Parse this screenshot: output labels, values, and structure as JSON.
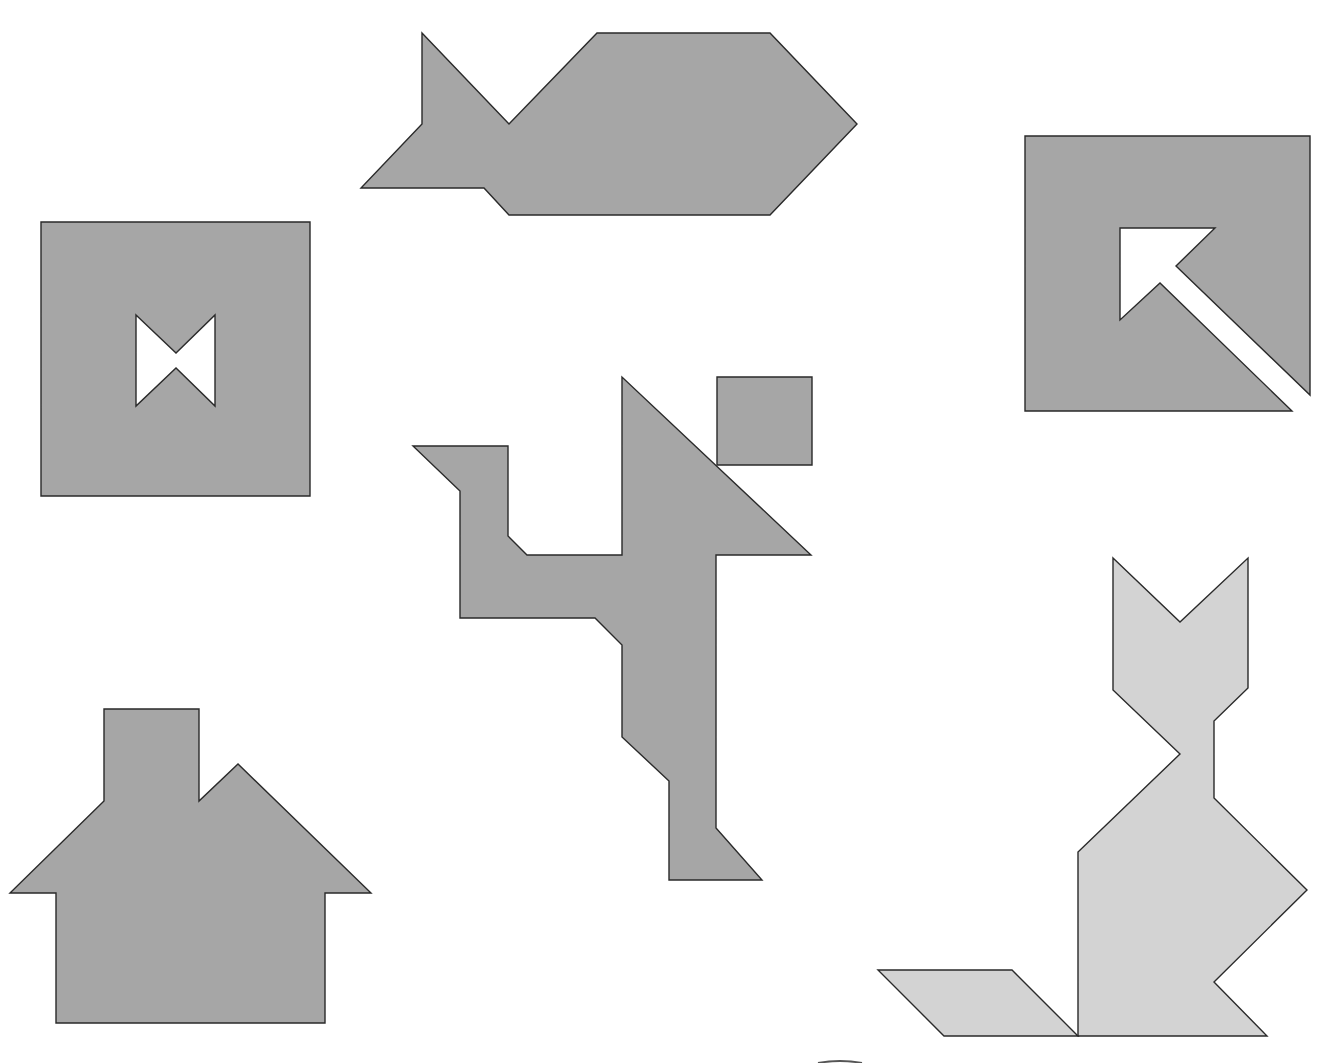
{
  "canvas": {
    "width": 1324,
    "height": 1063,
    "background": "#ffffff"
  },
  "colors": {
    "dark_fill": "#a6a6a6",
    "light_fill": "#d3d3d3",
    "hole_fill": "#ffffff",
    "stroke": "#2a2a2a"
  },
  "figures": [
    {
      "id": "fish",
      "label": "Fish",
      "fill": "dark_fill",
      "points": "422,33 509,124 597,33 770,33 857,124 770,215 509,215 484,188 361,188 422,124"
    },
    {
      "id": "square-with-bowtie",
      "label": "Square with bowtie hole",
      "fill": "dark_fill",
      "points": "41,222 310,222 310,496 41,496",
      "hole": "136,315 176,353 215,315 215,406 176,368 136,406"
    },
    {
      "id": "square-with-arrow",
      "label": "Square with arrow cut-out",
      "fill": "dark_fill",
      "points": "1025,136 1310,136 1310,395 1176,266 1215,228 1120,228 1120,320 1160,283 1292,411 1025,411"
    },
    {
      "id": "runner",
      "label": "Running figure",
      "fill": "dark_fill",
      "points": "413,446 508,446 508,536 527,555 622,555 622,377 811,555 716,555 716,828 762,880 669,880 669,781 622,737 622,645 595,618 460,618 460,491"
    },
    {
      "id": "runner-head",
      "label": "Runner head square",
      "fill": "dark_fill",
      "points": "717,377 812,377 812,465 717,465"
    },
    {
      "id": "house",
      "label": "House",
      "fill": "dark_fill",
      "points": "104,709 199,709 199,801 238,764 371,893 325,893 325,1023 56,1023 56,893 10,893 104,801"
    },
    {
      "id": "cat",
      "label": "Cat",
      "fill": "light_fill",
      "points": "1113,558 1180,622 1248,558 1248,688 1214,721 1214,798 1307,890 1214,982 1267,1036 1078,1036 1078,852 1180,754 1113,690"
    },
    {
      "id": "cat-tail",
      "label": "Cat tail parallelogram",
      "fill": "light_fill",
      "points": "878,970 1012,970 1078,1036 944,1036"
    }
  ],
  "partial_edge": {
    "x1": 818,
    "x2": 862,
    "y": 1062
  }
}
